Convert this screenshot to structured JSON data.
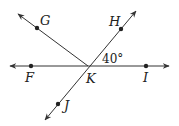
{
  "diagram": {
    "type": "geometry-lines-rays",
    "vertex": {
      "name": "K",
      "x": 88,
      "y": 66
    },
    "line_color": "#333333",
    "points": [
      {
        "id": "F",
        "label": "F",
        "x": 31,
        "y": 66,
        "lx": 25,
        "ly": 82
      },
      {
        "id": "I",
        "label": "I",
        "x": 146,
        "y": 66,
        "lx": 143,
        "ly": 82
      },
      {
        "id": "G",
        "label": "G",
        "x": 37,
        "y": 28,
        "lx": 40,
        "ly": 25
      },
      {
        "id": "H",
        "label": "H",
        "x": 121,
        "y": 29,
        "lx": 109,
        "ly": 26
      },
      {
        "id": "J",
        "label": "J",
        "x": 58,
        "y": 104,
        "lx": 64,
        "ly": 110
      }
    ],
    "vertex_label": {
      "label": "K",
      "x": 86,
      "y": 83
    },
    "angle_label": {
      "text": "40°",
      "x": 102,
      "y": 63
    }
  }
}
